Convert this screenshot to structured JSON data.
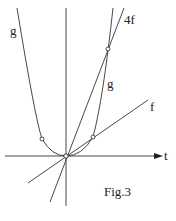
{
  "figure": {
    "caption": "Fig.3",
    "axis_label_t": "t",
    "curves": [
      {
        "id": "g",
        "label": "g",
        "type": "parabola",
        "label_positions": [
          "upper-left",
          "right-branch-middle"
        ]
      },
      {
        "id": "4f",
        "label": "4f",
        "type": "line"
      },
      {
        "id": "f",
        "label": "f",
        "type": "line"
      }
    ],
    "labels": {
      "g_left": "g",
      "g_right": "g",
      "four_f": "4f",
      "f": "f"
    },
    "marked_points": [
      {
        "name": "origin"
      },
      {
        "name": "g-f-intersection-left"
      },
      {
        "name": "g-f-intersection-right"
      },
      {
        "name": "g-4f-intersection"
      }
    ],
    "colors": {
      "stroke": "#333333",
      "background": "#ffffff"
    }
  }
}
